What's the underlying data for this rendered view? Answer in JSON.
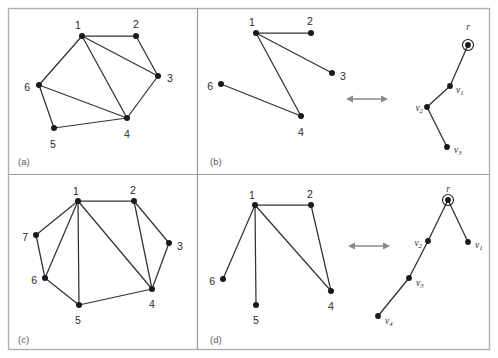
{
  "figure": {
    "width": 498,
    "height": 358,
    "frame_color": "#b0b0b0",
    "divider_color": "#9a9a9a",
    "edge_color": "#333333",
    "node_color": "#1a1a1a",
    "arrow_color": "#888888",
    "background": "#ffffff"
  },
  "panels": [
    {
      "id": "a",
      "label": "(a)",
      "label_x": 18,
      "label_y": 162,
      "box": {
        "x": 8,
        "y": 8,
        "w": 189,
        "h": 162
      },
      "graphs": [
        {
          "name": "graph-a",
          "nodes": [
            {
              "id": "1",
              "label": "1",
              "x": 82,
              "y": 36,
              "lx": 78,
              "ly": 26,
              "anchor": "middle"
            },
            {
              "id": "2",
              "label": "2",
              "x": 136,
              "y": 36,
              "lx": 136,
              "ly": 25,
              "anchor": "middle"
            },
            {
              "id": "3",
              "label": "3",
              "x": 158,
              "y": 76,
              "lx": 167,
              "ly": 79,
              "anchor": "start"
            },
            {
              "id": "4",
              "label": "4",
              "x": 127,
              "y": 118,
              "lx": 127,
              "ly": 135,
              "anchor": "middle"
            },
            {
              "id": "5",
              "label": "5",
              "x": 54,
              "y": 128,
              "lx": 53,
              "ly": 145,
              "anchor": "middle"
            },
            {
              "id": "6",
              "label": "6",
              "x": 39,
              "y": 85,
              "lx": 30,
              "ly": 88,
              "anchor": "end"
            }
          ],
          "edges": [
            [
              "1",
              "2"
            ],
            [
              "1",
              "3"
            ],
            [
              "1",
              "4"
            ],
            [
              "1",
              "6"
            ],
            [
              "2",
              "3"
            ],
            [
              "3",
              "4"
            ],
            [
              "4",
              "5"
            ],
            [
              "4",
              "6"
            ],
            [
              "5",
              "6"
            ]
          ]
        }
      ],
      "arrow": null,
      "tree": null
    },
    {
      "id": "b",
      "label": "(b)",
      "label_x": 210,
      "label_y": 162,
      "box": {
        "x": 199,
        "y": 8,
        "w": 291,
        "h": 162
      },
      "graphs": [
        {
          "name": "graph-b",
          "nodes": [
            {
              "id": "1",
              "label": "1",
              "x": 256,
              "y": 33,
              "lx": 252,
              "ly": 23,
              "anchor": "middle"
            },
            {
              "id": "2",
              "label": "2",
              "x": 311,
              "y": 33,
              "lx": 310,
              "ly": 22,
              "anchor": "middle"
            },
            {
              "id": "3",
              "label": "3",
              "x": 332,
              "y": 73,
              "lx": 340,
              "ly": 77,
              "anchor": "start"
            },
            {
              "id": "4",
              "label": "4",
              "x": 301,
              "y": 116,
              "lx": 301,
              "ly": 133,
              "anchor": "middle"
            },
            {
              "id": "6",
              "label": "6",
              "x": 221,
              "y": 84,
              "lx": 213,
              "ly": 87,
              "anchor": "end"
            }
          ],
          "edges": [
            [
              "1",
              "2"
            ],
            [
              "1",
              "3"
            ],
            [
              "1",
              "4"
            ],
            [
              "4",
              "6"
            ]
          ]
        }
      ],
      "arrow": {
        "x1": 346,
        "x2": 388,
        "y": 99
      },
      "tree": {
        "name": "tree-b",
        "root_ring_r": 5.5,
        "nodes": [
          {
            "id": "r",
            "label": "r",
            "sub": "",
            "x": 468,
            "y": 45,
            "lx": 468,
            "ly": 28,
            "anchor": "middle",
            "root": true
          },
          {
            "id": "v1",
            "label": "v",
            "sub": "1",
            "x": 450,
            "y": 86,
            "lx": 456,
            "ly": 91,
            "anchor": "start",
            "root": false
          },
          {
            "id": "v2",
            "label": "v",
            "sub": "2",
            "x": 427,
            "y": 107,
            "lx": 423,
            "ly": 109,
            "anchor": "end",
            "root": false
          },
          {
            "id": "v3",
            "label": "v",
            "sub": "3",
            "x": 447,
            "y": 147,
            "lx": 454,
            "ly": 151,
            "anchor": "start",
            "root": false
          }
        ],
        "edges": [
          [
            "r",
            "v1"
          ],
          [
            "v1",
            "v2"
          ],
          [
            "v2",
            "v3"
          ]
        ]
      }
    },
    {
      "id": "c",
      "label": "(c)",
      "label_x": 18,
      "label_y": 340,
      "box": {
        "x": 8,
        "y": 178,
        "w": 189,
        "h": 172
      },
      "graphs": [
        {
          "name": "graph-c",
          "nodes": [
            {
              "id": "1",
              "label": "1",
              "x": 78,
              "y": 201,
              "lx": 76,
              "ly": 192,
              "anchor": "middle"
            },
            {
              "id": "2",
              "label": "2",
              "x": 134,
              "y": 201,
              "lx": 133,
              "ly": 191,
              "anchor": "middle"
            },
            {
              "id": "3",
              "label": "3",
              "x": 169,
              "y": 243,
              "lx": 177,
              "ly": 247,
              "anchor": "start"
            },
            {
              "id": "4",
              "label": "4",
              "x": 152,
              "y": 289,
              "lx": 152,
              "ly": 305,
              "anchor": "middle"
            },
            {
              "id": "5",
              "label": "5",
              "x": 79,
              "y": 305,
              "lx": 78,
              "ly": 321,
              "anchor": "middle"
            },
            {
              "id": "6",
              "label": "6",
              "x": 45,
              "y": 278,
              "lx": 37,
              "ly": 281,
              "anchor": "end"
            },
            {
              "id": "7",
              "label": "7",
              "x": 36,
              "y": 235,
              "lx": 28,
              "ly": 238,
              "anchor": "end"
            }
          ],
          "edges": [
            [
              "1",
              "2"
            ],
            [
              "1",
              "4"
            ],
            [
              "1",
              "5"
            ],
            [
              "1",
              "6"
            ],
            [
              "1",
              "7"
            ],
            [
              "2",
              "3"
            ],
            [
              "2",
              "4"
            ],
            [
              "3",
              "4"
            ],
            [
              "4",
              "5"
            ],
            [
              "5",
              "6"
            ],
            [
              "6",
              "7"
            ]
          ]
        }
      ],
      "arrow": null,
      "tree": null
    },
    {
      "id": "d",
      "label": "(d)",
      "label_x": 210,
      "label_y": 340,
      "box": {
        "x": 199,
        "y": 178,
        "w": 291,
        "h": 172
      },
      "graphs": [
        {
          "name": "graph-d",
          "nodes": [
            {
              "id": "1",
              "label": "1",
              "x": 255,
              "y": 205,
              "lx": 252,
              "ly": 196,
              "anchor": "middle"
            },
            {
              "id": "2",
              "label": "2",
              "x": 311,
              "y": 205,
              "lx": 310,
              "ly": 195,
              "anchor": "middle"
            },
            {
              "id": "4",
              "label": "4",
              "x": 331,
              "y": 291,
              "lx": 331,
              "ly": 307,
              "anchor": "middle"
            },
            {
              "id": "5",
              "label": "5",
              "x": 256,
              "y": 305,
              "lx": 256,
              "ly": 321,
              "anchor": "middle"
            },
            {
              "id": "6",
              "label": "6",
              "x": 223,
              "y": 279,
              "lx": 215,
              "ly": 282,
              "anchor": "end"
            }
          ],
          "edges": [
            [
              "1",
              "2"
            ],
            [
              "1",
              "4"
            ],
            [
              "1",
              "5"
            ],
            [
              "1",
              "6"
            ],
            [
              "2",
              "4"
            ]
          ]
        }
      ],
      "arrow": {
        "x1": 348,
        "x2": 390,
        "y": 246
      },
      "tree": {
        "name": "tree-d",
        "root_ring_r": 5.5,
        "nodes": [
          {
            "id": "r",
            "label": "r",
            "sub": "",
            "x": 448,
            "y": 200,
            "lx": 448,
            "ly": 190,
            "anchor": "middle",
            "root": true
          },
          {
            "id": "v1",
            "label": "v",
            "sub": "1",
            "x": 468,
            "y": 242,
            "lx": 475,
            "ly": 246,
            "anchor": "start",
            "root": false
          },
          {
            "id": "v2",
            "label": "v",
            "sub": "2",
            "x": 428,
            "y": 241,
            "lx": 422,
            "ly": 244,
            "anchor": "end",
            "root": false
          },
          {
            "id": "v3",
            "label": "v",
            "sub": "3",
            "x": 409,
            "y": 278,
            "lx": 416,
            "ly": 284,
            "anchor": "start",
            "root": false
          },
          {
            "id": "v4",
            "label": "v",
            "sub": "4",
            "x": 378,
            "y": 316,
            "lx": 385,
            "ly": 322,
            "anchor": "start",
            "root": false
          }
        ],
        "edges": [
          [
            "r",
            "v1"
          ],
          [
            "r",
            "v2"
          ],
          [
            "v2",
            "v3"
          ],
          [
            "v3",
            "v4"
          ]
        ]
      }
    }
  ]
}
